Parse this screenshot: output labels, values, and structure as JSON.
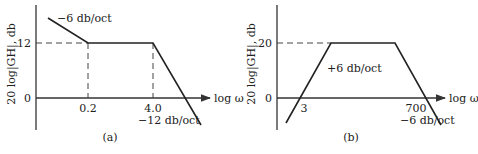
{
  "panels": [
    {
      "id": "a",
      "caption": "(a)",
      "y_label": "20 log|GH|, db",
      "x_label": "log ω",
      "y_ticks": [
        "12",
        "0"
      ],
      "x_ticks": [
        "0.2",
        "4.0"
      ],
      "slope_labels": [
        "−6 db/oct",
        "−12 db/oct"
      ],
      "level_db": 12,
      "breakpoints": [
        0.2,
        4.0
      ],
      "slopes_db_per_oct": [
        -6,
        0,
        -12
      ]
    },
    {
      "id": "b",
      "caption": "(b)",
      "y_label": "20 log|GH|, db",
      "x_label": "log ω",
      "y_ticks": [
        "20",
        "0"
      ],
      "x_ticks": [
        "3",
        "700"
      ],
      "slope_labels": [
        "+6 db/oct",
        "−6 db/oct"
      ],
      "level_db": 20,
      "zero_crossings": [
        3,
        700
      ],
      "slopes_db_per_oct": [
        6,
        0,
        -6
      ]
    }
  ]
}
